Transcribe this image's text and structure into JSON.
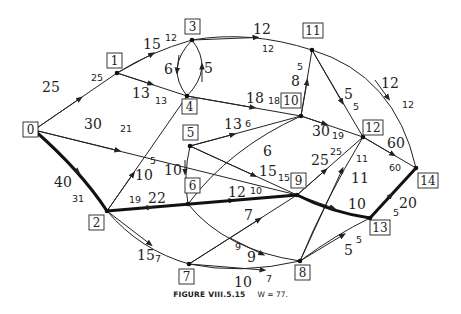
{
  "figure": {
    "caption_title": "FIGURE VIII.5.15",
    "caption_value": "W = 77."
  },
  "nodes": [
    {
      "id": "0",
      "x": 34,
      "y": 130,
      "lx": 30,
      "ly": 129
    },
    {
      "id": "1",
      "x": 117,
      "y": 73,
      "lx": 114,
      "ly": 60
    },
    {
      "id": "2",
      "x": 107,
      "y": 211,
      "lx": 96,
      "ly": 222
    },
    {
      "id": "3",
      "x": 192,
      "y": 40,
      "lx": 192,
      "ly": 26
    },
    {
      "id": "4",
      "x": 187,
      "y": 96,
      "lx": 189,
      "ly": 108
    },
    {
      "id": "5",
      "x": 190,
      "y": 146,
      "lx": 190,
      "ly": 132
    },
    {
      "id": "6",
      "x": 188,
      "y": 204,
      "lx": 192,
      "ly": 185
    },
    {
      "id": "7",
      "x": 189,
      "y": 264,
      "lx": 186,
      "ly": 277
    },
    {
      "id": "8",
      "x": 300,
      "y": 261,
      "lx": 302,
      "ly": 272
    },
    {
      "id": "9",
      "x": 297,
      "y": 195,
      "lx": 298,
      "ly": 180
    },
    {
      "id": "10",
      "x": 301,
      "y": 116,
      "lx": 290,
      "ly": 101
    },
    {
      "id": "11",
      "x": 312,
      "y": 50,
      "lx": 311,
      "ly": 31
    },
    {
      "id": "12",
      "x": 363,
      "y": 137,
      "lx": 370,
      "ly": 127
    },
    {
      "id": "13",
      "x": 370,
      "y": 218,
      "lx": 377,
      "ly": 229
    },
    {
      "id": "14",
      "x": 416,
      "y": 168,
      "lx": 430,
      "ly": 181
    }
  ],
  "edges": [
    {
      "from": "0",
      "to": "1",
      "weight": "25",
      "bound": "25",
      "critical": false
    },
    {
      "from": "0",
      "to": "2",
      "weight": "40",
      "bound": "31",
      "critical": true
    },
    {
      "from": "0",
      "to": "9",
      "weight": "30",
      "bound": "21",
      "critical": false
    },
    {
      "from": "1",
      "to": "3",
      "weight": "15",
      "bound": "12",
      "critical": false
    },
    {
      "from": "1",
      "to": "4",
      "weight": "13",
      "bound": "13",
      "critical": false
    },
    {
      "from": "3",
      "to": "4",
      "weight": "6",
      "bound": "",
      "critical": false
    },
    {
      "from": "4",
      "to": "3",
      "weight": "5",
      "bound": "",
      "critical": false
    },
    {
      "from": "3",
      "to": "11",
      "weight": "12",
      "bound": "12",
      "critical": false
    },
    {
      "from": "4",
      "to": "10",
      "weight": "18",
      "bound": "18",
      "critical": false
    },
    {
      "from": "2",
      "to": "4",
      "weight": "10",
      "bound": "5",
      "critical": false
    },
    {
      "from": "2",
      "to": "9",
      "weight": "22",
      "bound": "19",
      "critical": true
    },
    {
      "from": "2",
      "to": "7",
      "weight": "15",
      "bound": "7",
      "critical": false
    },
    {
      "from": "5",
      "to": "10",
      "weight": "13",
      "bound": "6",
      "critical": false
    },
    {
      "from": "5",
      "to": "6",
      "weight": "10",
      "bound": "",
      "critical": false
    },
    {
      "from": "5",
      "to": "9",
      "weight": "15",
      "bound": "15",
      "critical": false
    },
    {
      "from": "6",
      "to": "10",
      "weight": "6",
      "bound": "",
      "critical": false
    },
    {
      "from": "6",
      "to": "9",
      "weight": "12",
      "bound": "10",
      "critical": false
    },
    {
      "from": "6",
      "to": "8",
      "weight": "9",
      "bound": "9",
      "critical": false
    },
    {
      "from": "7",
      "to": "9",
      "weight": "7",
      "bound": "",
      "critical": false
    },
    {
      "from": "7",
      "to": "8",
      "weight": "10",
      "bound": "7",
      "critical": false
    },
    {
      "from": "10",
      "to": "11",
      "weight": "8",
      "bound": "5",
      "critical": false
    },
    {
      "from": "10",
      "to": "12",
      "weight": "30",
      "bound": "19",
      "critical": false
    },
    {
      "from": "11",
      "to": "12",
      "weight": "5",
      "bound": "5",
      "critical": false
    },
    {
      "from": "11",
      "to": "14",
      "weight": "12",
      "bound": "12",
      "critical": false
    },
    {
      "from": "9",
      "to": "12",
      "weight": "25",
      "bound": "25",
      "critical": false
    },
    {
      "from": "9",
      "to": "13",
      "weight": "10",
      "bound": "",
      "critical": true
    },
    {
      "from": "8",
      "to": "12",
      "weight": "11",
      "bound": "11",
      "critical": false
    },
    {
      "from": "8",
      "to": "13",
      "weight": "5",
      "bound": "5",
      "critical": false
    },
    {
      "from": "12",
      "to": "14",
      "weight": "60",
      "bound": "60",
      "critical": false
    },
    {
      "from": "13",
      "to": "14",
      "weight": "20",
      "bound": "5",
      "critical": true
    }
  ],
  "labels": {
    "e01_w": "25",
    "e01_b": "25",
    "e02_w": "40",
    "e02_b": "31",
    "e09_w": "30",
    "e09_b": "21",
    "e13_w": "15",
    "e13_b": "12",
    "e14_w": "13",
    "e14_b": "13",
    "e34_w": "6",
    "e43_w": "5",
    "e311_w": "12",
    "e311_b": "12",
    "e410_w": "18",
    "e410_b": "18",
    "e24_w": "10",
    "e24_b": "5",
    "e29_w": "22",
    "e29_b": "19",
    "e27_w": "15",
    "e27_b": "7",
    "e510_w": "13",
    "e510_b": "6",
    "e56_w": "10",
    "e59_w": "15",
    "e59_b": "15",
    "e610_w": "6",
    "e69_w": "12",
    "e69_b": "10",
    "e68_w": "9",
    "e68_b": "9",
    "e79_w": "7",
    "e78_w": "10",
    "e78_b": "7",
    "e1011_w": "8",
    "e1011_b": "5",
    "e1012_w": "30",
    "e1012_b": "19",
    "e1112_w": "5",
    "e1112_b": "5",
    "e1114_w": "12",
    "e1114_b": "12",
    "e912_w": "25",
    "e912_b": "25",
    "e913_w": "10",
    "e812_w": "11",
    "e812_b": "11",
    "e813_w": "5",
    "e813_b": "5",
    "e1214_w": "60",
    "e1214_b": "60",
    "e1314_w": "20",
    "e1314_b": "5"
  }
}
